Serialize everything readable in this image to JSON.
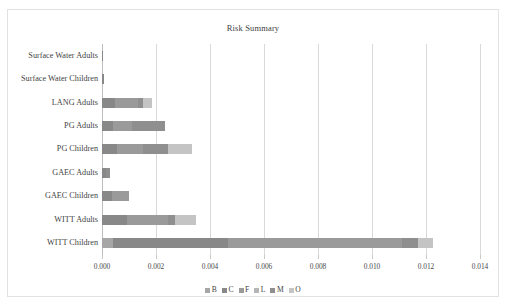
{
  "chart_data": {
    "type": "bar",
    "orientation": "horizontal",
    "stacked": true,
    "title": "Risk Summary",
    "xlabel": "",
    "ylabel": "",
    "xlim": [
      0.0,
      0.014
    ],
    "xticks": [
      0.0,
      0.002,
      0.004,
      0.006,
      0.008,
      0.01,
      0.012,
      0.014
    ],
    "xtick_labels": [
      "0.000",
      "0.002",
      "0.004",
      "0.006",
      "0.008",
      "0.010",
      "0.012",
      "0.014"
    ],
    "grid": "vertical",
    "legend_position": "bottom",
    "categories": [
      "Surface Water Adults",
      "Surface Water Children",
      "LANG Adults",
      "PG Adults",
      "PG Children",
      "GAEC Adults",
      "GAEC Children",
      "WITT Adults",
      "WITT Children"
    ],
    "series": [
      {
        "name": "B",
        "color": "#a6a6a6",
        "values": [
          0.0,
          0.0,
          0.0,
          0.0,
          0.0,
          0.0,
          0.0,
          0.0,
          0.00042
        ]
      },
      {
        "name": "C",
        "color": "#888888",
        "values": [
          4e-05,
          7e-05,
          0.00048,
          0.00042,
          0.00057,
          0.00013,
          0.00037,
          0.00092,
          0.00425
        ]
      },
      {
        "name": "F",
        "color": "#9a9a9a",
        "values": [
          0.0,
          0.0,
          0.00085,
          0.00069,
          0.00096,
          0.0,
          0.00063,
          0.00154,
          0.00646
        ]
      },
      {
        "name": "L",
        "color": "#b5b5b5",
        "values": [
          0.0,
          0.0,
          0.0,
          0.0,
          0.0,
          0.0,
          0.0,
          0.0,
          0.0
        ]
      },
      {
        "name": "M",
        "color": "#8f8f8f",
        "values": [
          0.0,
          0.0,
          0.00018,
          0.00122,
          0.0009,
          0.00016,
          0.0,
          0.00026,
          0.00058
        ]
      },
      {
        "name": "O",
        "color": "#c4c4c4",
        "values": [
          0.0,
          0.0,
          0.00034,
          0.0,
          0.00089,
          0.0,
          0.0,
          0.00076,
          0.00056
        ]
      }
    ],
    "totals": [
      4e-05,
      7e-05,
      0.00185,
      0.00233,
      0.00332,
      0.00029,
      0.001,
      0.00348,
      0.01227
    ]
  },
  "legend": {
    "entries": [
      "B",
      "C",
      "F",
      "L",
      "M",
      "O"
    ]
  }
}
